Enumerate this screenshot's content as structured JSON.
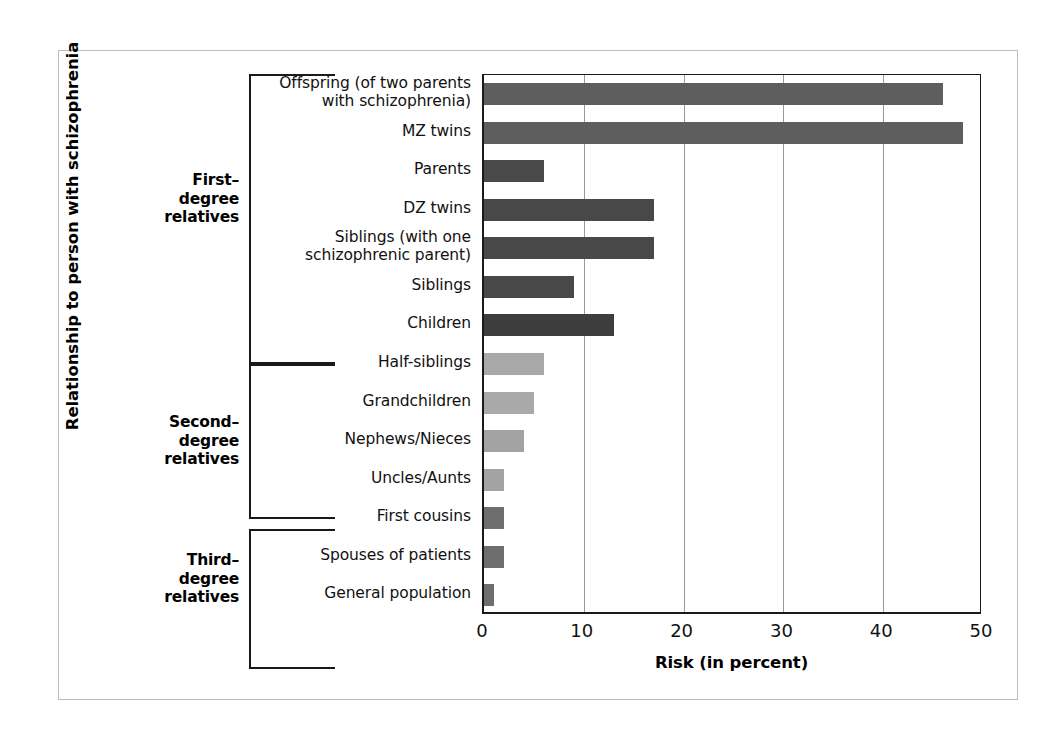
{
  "figure": {
    "y_axis_title": "Relationship to person with schizophrenia",
    "x_axis_title": "Risk (in percent)"
  },
  "groups": [
    {
      "id": "first-degree",
      "label": "First–\ndegree\nrelatives",
      "line1": "First–",
      "line2": "degree",
      "line3": "relatives"
    },
    {
      "id": "second-degree",
      "label": "Second–\ndegree\nrelatives",
      "line1": "Second–",
      "line2": "degree",
      "line3": "relatives"
    },
    {
      "id": "third-degree",
      "label": "Third–\ndegree\nrelatives",
      "line1": "Third–",
      "line2": "degree",
      "line3": "relatives"
    }
  ],
  "chart_data": {
    "type": "bar",
    "orientation": "horizontal",
    "title": "",
    "xlabel": "Risk (in percent)",
    "ylabel": "Relationship to person with schizophrenia",
    "xlim": [
      0,
      50
    ],
    "xticks": [
      0,
      10,
      20,
      30,
      40,
      50
    ],
    "xtick_labels": [
      "0",
      "10",
      "20",
      "30",
      "40",
      "50"
    ],
    "grid": "vertical",
    "legend": "none",
    "categories": [
      "Offspring (of two parents with schizophrenia)",
      "MZ twins",
      "Parents",
      "DZ twins",
      "Siblings (with one schizophrenic parent)",
      "Siblings",
      "Children",
      "Half-siblings",
      "Grandchildren",
      "Nephews/Nieces",
      "Uncles/Aunts",
      "First cousins",
      "Spouses  of patients",
      "General population"
    ],
    "values": [
      46,
      48,
      6,
      17,
      17,
      9,
      13,
      6,
      5,
      4,
      2,
      2,
      2,
      1
    ],
    "bars": [
      {
        "label_line1": "Offspring (of two parents",
        "label_line2": "with schizophrenia)",
        "value": 46,
        "group": "first-degree",
        "color": "#5e5e5e"
      },
      {
        "label_line1": "MZ twins",
        "label_line2": "",
        "value": 48,
        "group": "first-degree",
        "color": "#5e5e5e"
      },
      {
        "label_line1": "Parents",
        "label_line2": "",
        "value": 6,
        "group": "first-degree",
        "color": "#4a4a4a"
      },
      {
        "label_line1": "DZ twins",
        "label_line2": "",
        "value": 17,
        "group": "first-degree",
        "color": "#484848"
      },
      {
        "label_line1": "Siblings (with one",
        "label_line2": "schizophrenic parent)",
        "value": 17,
        "group": "first-degree",
        "color": "#484848"
      },
      {
        "label_line1": "Siblings",
        "label_line2": "",
        "value": 9,
        "group": "first-degree",
        "color": "#484848"
      },
      {
        "label_line1": "Children",
        "label_line2": "",
        "value": 13,
        "group": "first-degree",
        "color": "#3d3d3d"
      },
      {
        "label_line1": "Half-siblings",
        "label_line2": "",
        "value": 6,
        "group": "second-degree",
        "color": "#a9a9a9"
      },
      {
        "label_line1": "Grandchildren",
        "label_line2": "",
        "value": 5,
        "group": "second-degree",
        "color": "#a9a9a9"
      },
      {
        "label_line1": "Nephews/Nieces",
        "label_line2": "",
        "value": 4,
        "group": "second-degree",
        "color": "#a3a3a3"
      },
      {
        "label_line1": "Uncles/Aunts",
        "label_line2": "",
        "value": 2,
        "group": "second-degree",
        "color": "#a3a3a3"
      },
      {
        "label_line1": "First cousins",
        "label_line2": "",
        "value": 2,
        "group": "third-degree",
        "color": "#6e6e6e"
      },
      {
        "label_line1": "Spouses  of patients",
        "label_line2": "",
        "value": 2,
        "group": "third-degree",
        "color": "#6e6e6e"
      },
      {
        "label_line1": "General population",
        "label_line2": "",
        "value": 1,
        "group": "third-degree",
        "color": "#6e6e6e"
      }
    ]
  },
  "colors": {
    "first_degree_bar": "#4a4a4a",
    "second_degree_bar": "#a9a9a9",
    "third_degree_bar": "#6e6e6e",
    "axis": "#1a1a1a",
    "gridline": "#9a9a9a",
    "frame_border": "#bdbdbd",
    "background": "#ffffff"
  }
}
